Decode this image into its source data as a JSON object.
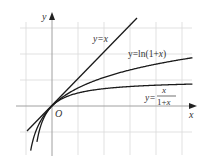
{
  "figure": {
    "type": "function-graph",
    "grid": true,
    "axes": {
      "x_label": "x",
      "y_label": "y",
      "origin_label": "O"
    },
    "curves": [
      {
        "name": "line",
        "label": "y=x",
        "expr": "x"
      },
      {
        "name": "log",
        "label": "y=ln(1+x)",
        "expr": "ln(1+x)"
      },
      {
        "name": "rational",
        "label_prefix": "y=",
        "label_num": "x",
        "label_den": "1+x",
        "expr": "x/(1+x)"
      }
    ]
  },
  "labels": {
    "y_axis": "y",
    "x_axis": "x",
    "origin": "O",
    "line": "y=x",
    "log_prefix": "y=ln(1+",
    "log_var": "x",
    "log_suffix": ")",
    "rat_prefix": "y=",
    "rat_num": "x",
    "rat_den_1": "1+",
    "rat_den_x": "x"
  },
  "colors": {
    "grid": "#d6d6d6",
    "axis": "#9a9a9a",
    "curve": "#1a1a1a",
    "text": "#333333"
  }
}
